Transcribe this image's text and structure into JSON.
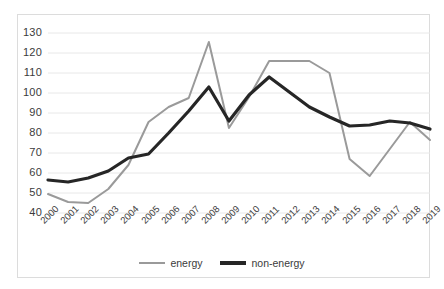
{
  "chart_data": {
    "type": "line",
    "title": "",
    "subtitle": "",
    "xlabel": "",
    "ylabel": "",
    "grid": true,
    "legend_position": "bottom",
    "ylim": [
      40,
      130
    ],
    "yticks": [
      40,
      50,
      60,
      70,
      80,
      90,
      100,
      110,
      120,
      130
    ],
    "categories": [
      "2000",
      "2001",
      "2002",
      "2003",
      "2004",
      "2005",
      "2006",
      "2007",
      "2008",
      "2009",
      "2010",
      "2011",
      "2012",
      "2013",
      "2014",
      "2015",
      "2016",
      "2017",
      "2018",
      "2019"
    ],
    "series": [
      {
        "name": "energy",
        "color": "#9a9a9a",
        "width": 2,
        "values": [
          49.5,
          45.5,
          45.0,
          52.0,
          64.0,
          85.5,
          93.0,
          97.5,
          125.5,
          82.5,
          98.0,
          116.0,
          116.0,
          116.0,
          110.0,
          67.0,
          58.5,
          72.0,
          85.5,
          76.5
        ]
      },
      {
        "name": "non-energy",
        "color": "#262626",
        "width": 3.2,
        "values": [
          56.5,
          55.5,
          57.5,
          61.0,
          67.5,
          69.5,
          80.0,
          91.0,
          103.0,
          86.0,
          99.0,
          108.0,
          100.5,
          93.0,
          88.0,
          83.5,
          84.0,
          86.0,
          85.0,
          82.0
        ]
      }
    ]
  },
  "legend": {
    "items": [
      {
        "label": "energy"
      },
      {
        "label": "non-energy"
      }
    ]
  },
  "colors": {
    "energy": "#9a9a9a",
    "non_energy": "#262626",
    "grid": "#e8e8e8",
    "border": "#dcdcdc",
    "text": "#3b3b3b"
  }
}
